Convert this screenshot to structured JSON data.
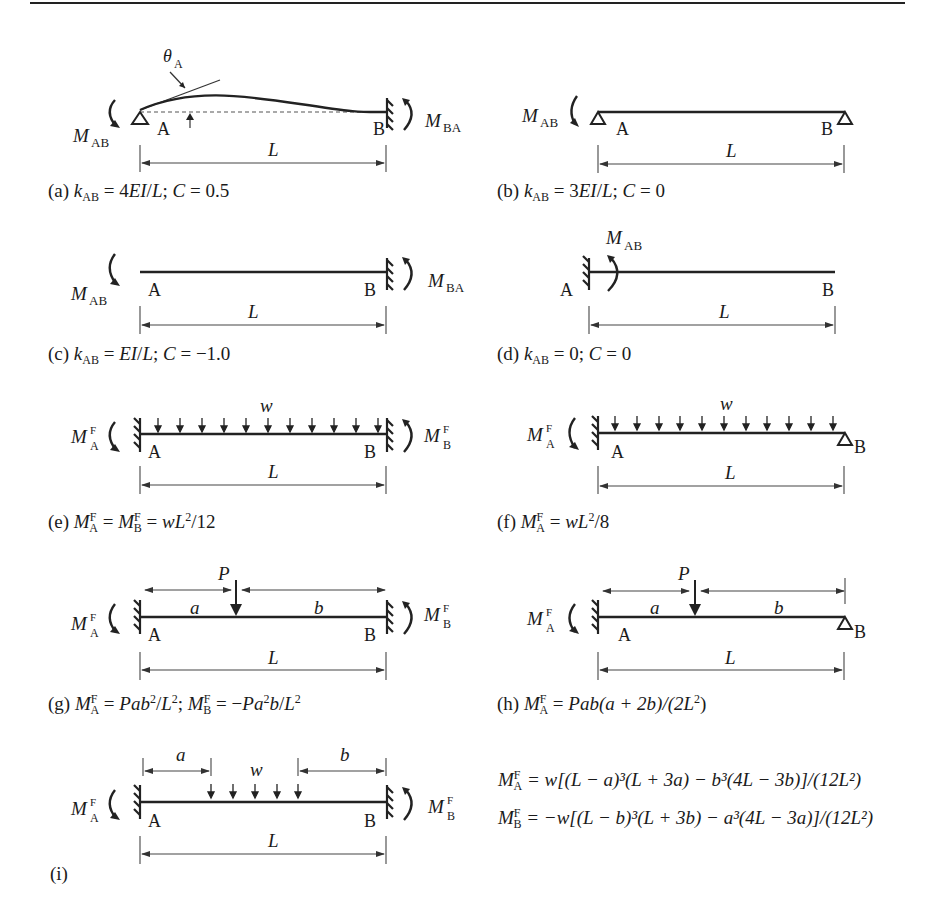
{
  "figure": {
    "panels": [
      {
        "id": "a",
        "support_left": "pin",
        "support_right": "fixed",
        "labels": {
          "left_node": "A",
          "right_node": "B",
          "span": "L",
          "moment_left": "M",
          "moment_left_sub": "AB",
          "moment_right": "M",
          "moment_right_sub": "BA",
          "rotation": "θ",
          "rotation_sub": "A"
        },
        "caption": {
          "label": "(a)",
          "k": "k",
          "k_sub": "AB",
          "k_value": "= 4EI/L;",
          "c_text": "C = 0.5"
        }
      },
      {
        "id": "b",
        "support_left": "pin",
        "support_right": "roller",
        "labels": {
          "left_node": "A",
          "right_node": "B",
          "span": "L",
          "moment_left": "M",
          "moment_left_sub": "AB"
        },
        "caption": {
          "label": "(b)",
          "k": "k",
          "k_sub": "AB",
          "k_value": "= 3EI/L;",
          "c_text": "C = 0"
        }
      },
      {
        "id": "c",
        "support_left": "free",
        "support_right": "fixed",
        "labels": {
          "left_node": "A",
          "right_node": "B",
          "span": "L",
          "moment_left": "M",
          "moment_left_sub": "AB",
          "moment_right": "M",
          "moment_right_sub": "BA"
        },
        "caption": {
          "label": "(c)",
          "k": "k",
          "k_sub": "AB",
          "k_value": "= EI/L;",
          "c_text": "C = −1.0"
        }
      },
      {
        "id": "d",
        "support_left": "fixed",
        "support_right": "free",
        "labels": {
          "left_node": "A",
          "right_node": "B",
          "span": "L",
          "moment_left": "M",
          "moment_left_sub": "AB"
        },
        "caption": {
          "label": "(d)",
          "k": "k",
          "k_sub": "AB",
          "k_value": "= 0;",
          "c_text": "C = 0"
        }
      },
      {
        "id": "e",
        "support_left": "fixed",
        "support_right": "fixed",
        "load": "uniform",
        "labels": {
          "left_node": "A",
          "right_node": "B",
          "span": "L",
          "load": "w",
          "moment_left": "M",
          "moment_left_sup": "F",
          "moment_left_sub": "A",
          "moment_right": "M",
          "moment_right_sup": "F",
          "moment_right_sub": "B"
        },
        "caption": {
          "label": "(e)",
          "text": "M_A^F = M_B^F = wL²/12"
        }
      },
      {
        "id": "f",
        "support_left": "fixed",
        "support_right": "roller",
        "load": "uniform",
        "labels": {
          "left_node": "A",
          "right_node": "B",
          "span": "L",
          "load": "w",
          "moment_left": "M",
          "moment_left_sup": "F",
          "moment_left_sub": "A"
        },
        "caption": {
          "label": "(f)",
          "text": "M_A^F = wL²/8"
        }
      },
      {
        "id": "g",
        "support_left": "fixed",
        "support_right": "fixed",
        "load": "point",
        "labels": {
          "left_node": "A",
          "right_node": "B",
          "span": "L",
          "load": "P",
          "dist_a": "a",
          "dist_b": "b",
          "moment_left": "M",
          "moment_left_sup": "F",
          "moment_left_sub": "A",
          "moment_right": "M",
          "moment_right_sup": "F",
          "moment_right_sub": "B"
        },
        "caption": {
          "label": "(g)",
          "text": "M_A^F = Pab²/L²; M_B^F = −Pa²b/L²"
        }
      },
      {
        "id": "h",
        "support_left": "fixed",
        "support_right": "roller",
        "load": "point",
        "labels": {
          "left_node": "A",
          "right_node": "B",
          "span": "L",
          "load": "P",
          "dist_a": "a",
          "dist_b": "b",
          "moment_left": "M",
          "moment_left_sup": "F",
          "moment_left_sub": "A"
        },
        "caption": {
          "label": "(h)",
          "text": "M_A^F = Pab(a + 2b)/(2L²)"
        }
      },
      {
        "id": "i",
        "support_left": "fixed",
        "support_right": "fixed",
        "load": "partial-uniform",
        "labels": {
          "left_node": "A",
          "right_node": "B",
          "span": "L",
          "load": "w",
          "dist_a": "a",
          "dist_b": "b",
          "moment_left": "M",
          "moment_left_sup": "F",
          "moment_left_sub": "A",
          "moment_right": "M",
          "moment_right_sup": "F",
          "moment_right_sub": "B"
        },
        "caption": {
          "label": "(i)"
        },
        "formulas": [
          {
            "lhs": "M",
            "sup": "F",
            "sub": "A",
            "rhs": "= w[(L − a)³(L + 3a) − b³(4L − 3b)]/(12L²)"
          },
          {
            "lhs": "M",
            "sup": "F",
            "sub": "B",
            "rhs": "= −w[(L − b)³(L + 3b) − a³(4L − 3a)]/(12L²)"
          }
        ]
      }
    ]
  },
  "captions": {
    "a": {
      "prefix": "(a) ",
      "k": "k",
      "k_sub": "AB",
      "mid": " = 4",
      "ei": "EI",
      "slash": "/",
      "l": "L",
      "semi": "; ",
      "c": "C",
      "val": " = 0.5"
    },
    "b": {
      "prefix": "(b) ",
      "k": "k",
      "k_sub": "AB",
      "mid": " = 3",
      "ei": "EI",
      "slash": "/",
      "l": "L",
      "semi": "; ",
      "c": "C",
      "val": " = 0"
    },
    "c": {
      "prefix": "(c) ",
      "k": "k",
      "k_sub": "AB",
      "mid": " = ",
      "ei": "EI",
      "slash": "/",
      "l": "L",
      "semi": "; ",
      "c": "C",
      "val": " = −1.0"
    },
    "d": {
      "prefix": "(d) ",
      "k": "k",
      "k_sub": "AB",
      "mid": " = 0; ",
      "c": "C",
      "val": " = 0"
    },
    "e": {
      "prefix": "(e) ",
      "m": "M",
      "sup": "F",
      "sub_a": "A",
      "sub_b": "B",
      "eq": " = ",
      "w": "w",
      "l": "L",
      "sq": "2",
      "tail": "/12"
    },
    "f": {
      "prefix": "(f) ",
      "m": "M",
      "sup": "F",
      "sub_a": "A",
      "eq": " = ",
      "w": "w",
      "l": "L",
      "sq": "2",
      "tail": "/8"
    },
    "g": {
      "prefix": "(g) ",
      "m": "M",
      "sup": "F",
      "sub_a": "A",
      "sub_b": "B",
      "p": "P",
      "ab": "ab",
      "a": "a",
      "b": "b",
      "l": "L",
      "sq": "2"
    },
    "h": {
      "prefix": "(h) ",
      "m": "M",
      "sup": "F",
      "sub_a": "A",
      "p": "P",
      "ab": "ab",
      "paren": "(a + 2b)/(2L",
      "sq": "2",
      "close": ")"
    },
    "i": {
      "prefix": "(i)"
    }
  },
  "formulas_i": {
    "line1": {
      "m": "M",
      "sup": "F",
      "sub": "A",
      "rhs": " = w[(L − a)³(L + 3a) − b³(4L − 3b)]/(12L²)"
    },
    "line2": {
      "m": "M",
      "sup": "F",
      "sub": "B",
      "rhs": " = −w[(L − b)³(L + 3b) − a³(4L − 3a)]/(12L²)"
    }
  },
  "colors": {
    "ink": "#1a1a1a",
    "background": "#ffffff"
  }
}
